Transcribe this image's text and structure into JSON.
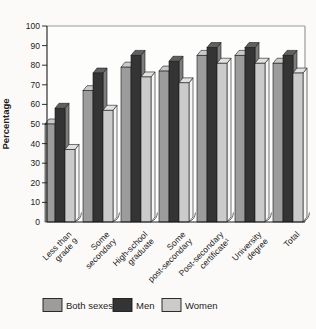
{
  "figure": {
    "kind": "scanned-statistical-figure"
  },
  "chart_data": {
    "type": "bar",
    "style": "3d-grouped-bars",
    "title": "",
    "xlabel": "",
    "ylabel": "Percentage",
    "ylim": [
      0,
      100
    ],
    "ytick_step": 10,
    "yticks": [
      0,
      10,
      20,
      30,
      40,
      50,
      60,
      70,
      80,
      90,
      100
    ],
    "grid": false,
    "legend_position": "bottom",
    "categories": [
      "Less than grade 9",
      "Some secondary",
      "High-school graduate",
      "Some post-secondary",
      "Post-secondary certificate¹",
      "University degree",
      "Total"
    ],
    "category_lines": [
      [
        "Less than",
        "grade 9"
      ],
      [
        "Some",
        "secondary"
      ],
      [
        "High-school",
        "graduate"
      ],
      [
        "Some",
        "post-secondary"
      ],
      [
        "Post-secondary",
        "certificate¹"
      ],
      [
        "University",
        "degree"
      ],
      [
        "Total"
      ]
    ],
    "series": [
      {
        "name": "Both sexes",
        "values": [
          50,
          67,
          79,
          77,
          85,
          85,
          81
        ],
        "color": "#9c9c9c",
        "top_color": "#c9c9c9",
        "side_color": "#e6e6e6"
      },
      {
        "name": "Men",
        "values": [
          58,
          76,
          85,
          82,
          89,
          89,
          85
        ],
        "color": "#343434",
        "top_color": "#606060",
        "side_color": "#7d7d7d"
      },
      {
        "name": "Women",
        "values": [
          37,
          57,
          74,
          71,
          81,
          81,
          76
        ],
        "color": "#cbcbcb",
        "top_color": "#e2e2e2",
        "side_color": "#f5f5f5"
      }
    ],
    "colors": {
      "axis": "#1b1b1b",
      "frame": "#9a9a9a",
      "outline": "#1a1a1a",
      "plot_background": "#fdfdfc"
    }
  }
}
